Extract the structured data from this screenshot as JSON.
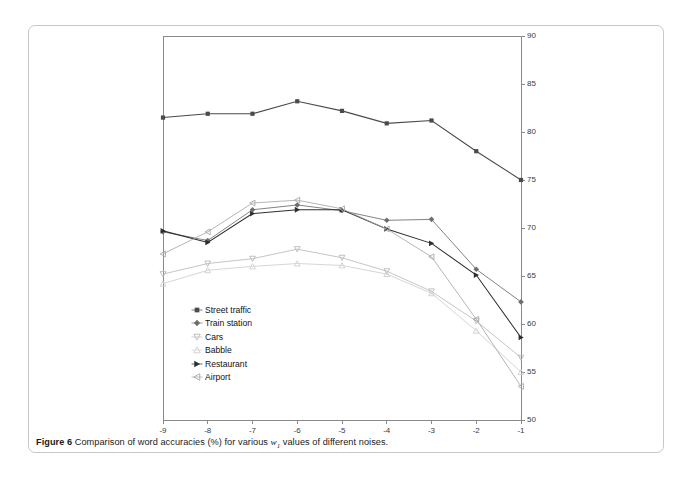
{
  "caption": {
    "label": "Figure 6",
    "text_before": "Comparison of word accuracies (%) for various ",
    "variable": "w",
    "subscript": "1",
    "text_after": " values of different noises."
  },
  "chart_data": {
    "type": "line",
    "title": "",
    "xlabel": "",
    "ylabel": "",
    "x": [
      -9,
      -8,
      -7,
      -6,
      -5,
      -4,
      -3,
      -2,
      -1
    ],
    "xticklabels": [
      "-9",
      "-8",
      "-7",
      "-6",
      "-5",
      "-4",
      "-3",
      "-2",
      "-1"
    ],
    "yticks": [
      50,
      55,
      60,
      65,
      70,
      75,
      80,
      85,
      90
    ],
    "yticklabels": [
      "50",
      "55",
      "60",
      "65",
      "70",
      "75",
      "80",
      "85",
      "90"
    ],
    "ylim": [
      50,
      90
    ],
    "xlim": [
      -9,
      -1
    ],
    "grid": false,
    "legend_position": "lower-left-inside",
    "yaxis_side": "right",
    "series": [
      {
        "name": "Street traffic",
        "marker": "square",
        "color": "#4a4a4a",
        "values": [
          81.5,
          81.9,
          81.9,
          83.2,
          82.2,
          80.9,
          81.2,
          78.0,
          75.0
        ]
      },
      {
        "name": "Train station",
        "marker": "diamond",
        "color": "#6d6d6d",
        "values": [
          69.6,
          68.7,
          71.9,
          72.4,
          71.8,
          70.8,
          70.9,
          65.7,
          62.3
        ]
      },
      {
        "name": "Cars",
        "marker": "triangle-down",
        "color": "#b9b9b9",
        "values": [
          65.2,
          66.3,
          66.8,
          67.8,
          66.9,
          65.5,
          63.4,
          60.3,
          56.5
        ]
      },
      {
        "name": "Babble",
        "marker": "triangle-up",
        "color": "#cfcfcf",
        "values": [
          64.2,
          65.6,
          66.0,
          66.3,
          66.1,
          65.2,
          63.2,
          59.3,
          55.0
        ]
      },
      {
        "name": "Restaurant",
        "marker": "triangle-right",
        "color": "#2e2e2e",
        "values": [
          69.7,
          68.5,
          71.5,
          71.9,
          71.9,
          69.9,
          68.4,
          65.1,
          58.6
        ]
      },
      {
        "name": "Airport",
        "marker": "triangle-left",
        "color": "#a8a8a8",
        "values": [
          67.3,
          69.6,
          72.6,
          72.9,
          72.0,
          69.9,
          67.0,
          60.5,
          53.5
        ]
      }
    ]
  }
}
